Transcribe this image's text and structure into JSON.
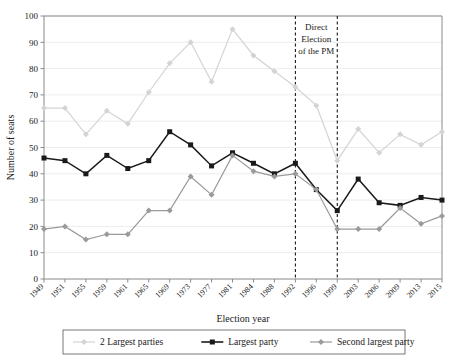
{
  "chart_data": {
    "type": "line",
    "title": "",
    "xlabel": "Election year",
    "ylabel": "Number of seats",
    "ylim": [
      0,
      100
    ],
    "ytick_step": 10,
    "yticks": [
      0,
      10,
      20,
      30,
      40,
      50,
      60,
      70,
      80,
      90,
      100
    ],
    "grid": true,
    "legend_position": "bottom",
    "categories": [
      "1949",
      "1951",
      "1955",
      "1959",
      "1961",
      "1965",
      "1969",
      "1973",
      "1977",
      "1981",
      "1984",
      "1988",
      "1992",
      "1996",
      "1999",
      "2003",
      "2006",
      "2009",
      "2013",
      "2015"
    ],
    "series": [
      {
        "name": "2 Largest parties",
        "color": "#d4d4d4",
        "marker": "diamond",
        "values": [
          65,
          65,
          55,
          64,
          59,
          71,
          82,
          90,
          75,
          95,
          85,
          79,
          73,
          66,
          45,
          57,
          48,
          55,
          51,
          56
        ]
      },
      {
        "name": "Largest party",
        "color": "#1a1a1a",
        "marker": "square",
        "values": [
          46,
          45,
          40,
          47,
          42,
          45,
          56,
          51,
          43,
          48,
          44,
          40,
          44,
          34,
          26,
          38,
          29,
          28,
          31,
          30
        ]
      },
      {
        "name": "Second largest party",
        "color": "#9a9a9a",
        "marker": "diamond",
        "values": [
          19,
          20,
          15,
          17,
          17,
          26,
          26,
          39,
          32,
          47,
          41,
          39,
          40,
          34,
          19,
          19,
          19,
          27,
          21,
          24
        ]
      }
    ],
    "annotations": [
      {
        "name": "direct-election-span",
        "text": "Direct Election of the PM",
        "lines": [
          "Direct",
          "Election",
          "of the PM"
        ],
        "from_category": "1992",
        "to_category": "1999"
      }
    ]
  },
  "legend": {
    "items": [
      {
        "label": "2 Largest parties",
        "color": "#d4d4d4",
        "marker": "diamond"
      },
      {
        "label": "Largest party",
        "color": "#1a1a1a",
        "marker": "square"
      },
      {
        "label": "Second largest party",
        "color": "#9a9a9a",
        "marker": "diamond"
      }
    ]
  }
}
